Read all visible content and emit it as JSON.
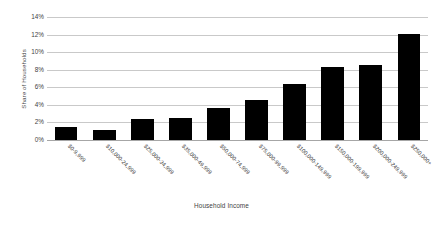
{
  "chart_data": {
    "type": "bar",
    "title": "",
    "xlabel": "Household Income",
    "ylabel": "Share of Households",
    "categories": [
      "$0-9,999",
      "$10,000-24,999",
      "$25,000-34,999",
      "$35,000-49,999",
      "$50,000-74,999",
      "$75,000-99,999",
      "$100,000-149,999",
      "$150,000-199,999",
      "$200,000-249,999",
      "$250,000+"
    ],
    "values": [
      1.5,
      1.1,
      2.4,
      2.5,
      3.6,
      4.6,
      6.4,
      8.3,
      8.5,
      12.1
    ],
    "ylim": [
      0,
      14
    ],
    "ytick_labels": [
      "14%",
      "12%",
      "10%",
      "8%",
      "6%",
      "4%",
      "2%",
      "0%"
    ],
    "ytick_values": [
      14,
      12,
      10,
      8,
      6,
      4,
      2,
      0
    ],
    "grid": true,
    "legend": false,
    "bar_color": "#000000",
    "grid_color": "#c9c9c9",
    "axis_color": "#a6a6a6",
    "text_color": "#3f3f3f",
    "background": "#ffffff"
  }
}
